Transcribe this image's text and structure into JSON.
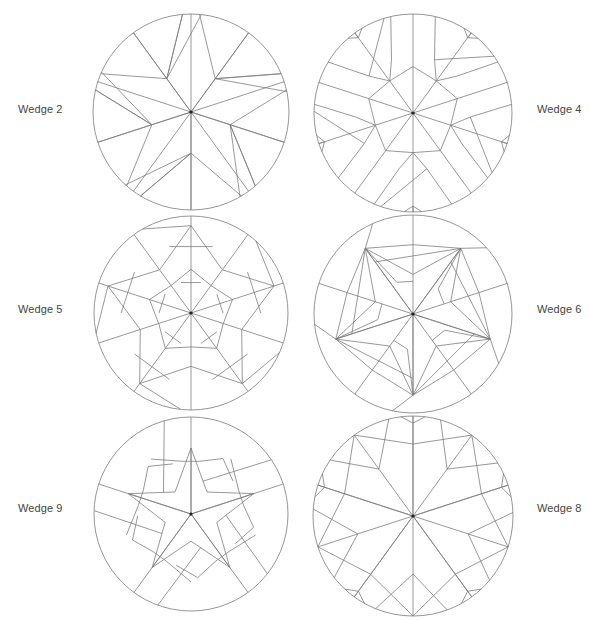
{
  "diagrams": [
    {
      "id": "wedge-2",
      "label": "Wedge 2",
      "label_pos": {
        "x": 18,
        "y": 103
      },
      "center": {
        "x": 191,
        "y": 112
      },
      "radius": 98,
      "symmetry": 5,
      "segments": [
        [
          [
            0,
            0
          ],
          [
            1,
            0
          ]
        ],
        [
          [
            0,
            0
          ],
          [
            1,
            180
          ]
        ],
        [
          [
            1,
            -5
          ],
          [
            0.42,
            -36
          ]
        ],
        [
          [
            1,
            5
          ],
          [
            0.42,
            36
          ]
        ],
        [
          [
            0.42,
            36
          ],
          [
            1,
            78
          ]
        ],
        [
          [
            0.42,
            36
          ],
          [
            1,
            67
          ]
        ],
        [
          [
            0,
            0
          ],
          [
            1,
            36
          ]
        ]
      ]
    },
    {
      "id": "wedge-4",
      "label": "Wedge 4",
      "label_pos": {
        "x": 537,
        "y": 103
      },
      "center": {
        "x": 413,
        "y": 113
      },
      "radius": 99,
      "symmetry": 5,
      "segments": [
        [
          [
            0,
            0
          ],
          [
            1,
            0
          ]
        ],
        [
          [
            0,
            0
          ],
          [
            0.77,
            36
          ]
        ],
        [
          [
            0.77,
            36
          ],
          [
            1,
            36
          ]
        ],
        [
          [
            0.47,
            0
          ],
          [
            0.4,
            36
          ]
        ],
        [
          [
            0.4,
            36
          ],
          [
            0.47,
            72
          ]
        ],
        [
          [
            1,
            -13
          ],
          [
            0.58,
            -22
          ]
        ],
        [
          [
            0.58,
            -22
          ],
          [
            0.4,
            -36
          ]
        ],
        [
          [
            1,
            13
          ],
          [
            0.58,
            22
          ]
        ],
        [
          [
            0.58,
            22
          ],
          [
            0.4,
            36
          ]
        ],
        [
          [
            0.58,
            22
          ],
          [
            1,
            55
          ]
        ],
        [
          [
            0.94,
            36
          ],
          [
            1,
            31
          ]
        ],
        [
          [
            0.94,
            36
          ],
          [
            1,
            41
          ]
        ],
        [
          [
            0.94,
            36
          ],
          [
            1,
            36
          ]
        ]
      ]
    },
    {
      "id": "wedge-5",
      "label": "Wedge 5",
      "label_pos": {
        "x": 18,
        "y": 303
      },
      "center": {
        "x": 191,
        "y": 313
      },
      "radius": 97,
      "symmetry": 5,
      "segments": [
        [
          [
            0,
            0
          ],
          [
            1,
            0
          ]
        ],
        [
          [
            0,
            0
          ],
          [
            0.55,
            36
          ]
        ],
        [
          [
            0.55,
            36
          ],
          [
            1,
            36
          ]
        ],
        [
          [
            0.45,
            0
          ],
          [
            0.35,
            36
          ]
        ],
        [
          [
            0.35,
            36
          ],
          [
            0.45,
            72
          ]
        ],
        [
          [
            0.9,
            0
          ],
          [
            0.55,
            36
          ]
        ],
        [
          [
            0.55,
            36
          ],
          [
            0.9,
            72
          ]
        ],
        [
          [
            0.9,
            0
          ],
          [
            1,
            -30
          ]
        ],
        [
          [
            0.33,
            -18
          ],
          [
            0.33,
            18
          ]
        ],
        [
          [
            0.72,
            -18
          ],
          [
            0.72,
            18
          ]
        ]
      ]
    },
    {
      "id": "wedge-6",
      "label": "Wedge 6",
      "label_pos": {
        "x": 537,
        "y": 303
      },
      "center": {
        "x": 413,
        "y": 314
      },
      "radius": 99,
      "symmetry": 5,
      "segments": [
        [
          [
            0,
            0
          ],
          [
            1,
            0
          ]
        ],
        [
          [
            0,
            0
          ],
          [
            0.82,
            36
          ]
        ],
        [
          [
            0.82,
            36
          ],
          [
            1,
            48
          ]
        ],
        [
          [
            0.82,
            36
          ],
          [
            0.65,
            -36
          ]
        ],
        [
          [
            0.82,
            36
          ],
          [
            0.4,
            0
          ]
        ],
        [
          [
            0.82,
            36
          ],
          [
            0.4,
            72
          ]
        ],
        [
          [
            0.82,
            36
          ],
          [
            0.36,
            45
          ]
        ],
        [
          [
            0.36,
            45
          ],
          [
            0.33,
            72
          ]
        ],
        [
          [
            0.82,
            36
          ],
          [
            0.7,
            0
          ]
        ],
        [
          [
            0.7,
            0
          ],
          [
            0.82,
            -36
          ]
        ],
        [
          [
            0,
            0
          ],
          [
            0.82,
            36
          ]
        ]
      ]
    },
    {
      "id": "wedge-9",
      "label": "Wedge 9",
      "label_pos": {
        "x": 18,
        "y": 502
      },
      "center": {
        "x": 191,
        "y": 514
      },
      "radius": 97,
      "symmetry": 5,
      "segments": [
        [
          [
            0,
            0
          ],
          [
            1,
            0
          ]
        ],
        [
          [
            0,
            0
          ],
          [
            0.68,
            0
          ]
        ],
        [
          [
            0.68,
            0
          ],
          [
            0.28,
            36
          ]
        ],
        [
          [
            0.28,
            36
          ],
          [
            0.68,
            72
          ]
        ],
        [
          [
            0.55,
            -9
          ],
          [
            0.55,
            9
          ]
        ],
        [
          [
            0.55,
            9
          ],
          [
            0.66,
            30
          ]
        ],
        [
          [
            0.66,
            30
          ],
          [
            0.55,
            52
          ]
        ],
        [
          [
            0.36,
            20
          ],
          [
            1,
            56
          ]
        ],
        [
          [
            0.55,
            -9
          ],
          [
            0.7,
            -36
          ]
        ],
        [
          [
            0.36,
            0
          ],
          [
            0.36,
            0
          ]
        ]
      ]
    },
    {
      "id": "wedge-8",
      "label": "Wedge 8",
      "label_pos": {
        "x": 537,
        "y": 502
      },
      "center": {
        "x": 413,
        "y": 516
      },
      "radius": 100,
      "symmetry": 5,
      "segments": [
        [
          [
            0,
            0
          ],
          [
            1,
            0
          ]
        ],
        [
          [
            0,
            0
          ],
          [
            0.58,
            36
          ]
        ],
        [
          [
            0.58,
            36
          ],
          [
            1,
            58
          ]
        ],
        [
          [
            0.58,
            36
          ],
          [
            1,
            16
          ]
        ],
        [
          [
            0.58,
            36
          ],
          [
            1,
            36
          ]
        ],
        [
          [
            0.72,
            0
          ],
          [
            1,
            36
          ]
        ],
        [
          [
            0.72,
            0
          ],
          [
            1,
            -36
          ]
        ],
        [
          [
            0.93,
            0
          ],
          [
            1,
            -7
          ]
        ],
        [
          [
            0.93,
            0
          ],
          [
            1,
            7
          ]
        ],
        [
          [
            0,
            0
          ],
          [
            1,
            -72
          ]
        ]
      ]
    }
  ],
  "style": {
    "rim_color": "#8a8a8a",
    "crease_color": "#7d7d7d",
    "center_dot_color": "#222222",
    "label_color": "#444444"
  }
}
